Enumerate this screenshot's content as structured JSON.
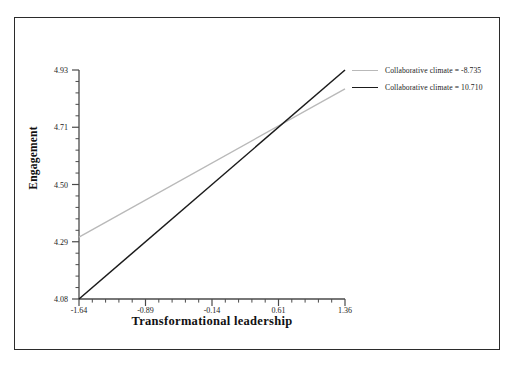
{
  "chart_data": {
    "type": "line",
    "title": "",
    "subtitle": "",
    "xlabel": "Transformational leadership",
    "ylabel": "Engagement",
    "xlim": [
      -1.64,
      1.36
    ],
    "ylim": [
      4.08,
      4.93
    ],
    "xticks": [
      "-1.64",
      "-0.89",
      "-0.14",
      "0.61",
      "1.36"
    ],
    "xtick_values": [
      -1.64,
      -0.89,
      -0.14,
      0.61,
      1.36
    ],
    "yticks": [
      "4.08",
      "4.29",
      "4.50",
      "4.71",
      "4.93"
    ],
    "ytick_values": [
      4.08,
      4.29,
      4.5,
      4.71,
      4.93
    ],
    "grid": false,
    "legend_position": "top-right",
    "x": [
      -1.64,
      1.36
    ],
    "series": [
      {
        "name": "Collaborative climate = -8.735",
        "color": "#b9b9b9",
        "values": [
          4.31,
          4.86
        ]
      },
      {
        "name": "Collaborative climate = 10.710",
        "color": "#1b1b1b",
        "values": [
          4.08,
          4.93
        ]
      }
    ],
    "annotations": []
  },
  "legend": {
    "entries": [
      {
        "label": "Collaborative climate = -8.735"
      },
      {
        "label": "Collaborative climate = 10.710"
      }
    ]
  },
  "axes": {
    "x_title": "Transformational leadership",
    "y_title": "Engagement",
    "x_tick_labels": [
      "-1.64",
      "-0.89",
      "-0.14",
      "0.61",
      "1.36"
    ],
    "y_tick_labels": [
      "4.08",
      "4.29",
      "4.50",
      "4.71",
      "4.93"
    ]
  },
  "colors": {
    "series_light": "#b9b9b9",
    "series_dark": "#1b1b1b",
    "axis": "#4a4a4a",
    "frame": "#2b2b2b",
    "text": "#1a1a1a"
  }
}
